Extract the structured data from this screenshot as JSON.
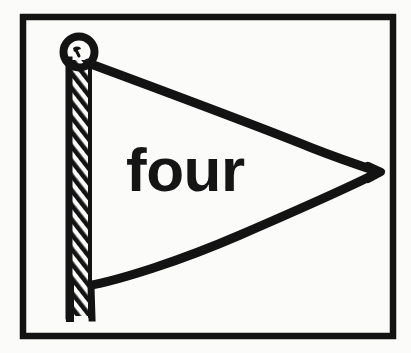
{
  "illustration": {
    "title": "four",
    "caption_word": "four",
    "subject": "pennant-flag-on-pole",
    "style": "black-and-white-line-drawing",
    "background_color": "#fbfbfa",
    "ink_color": "#131313",
    "frame": {
      "name": "picture-frame-border",
      "x": 20,
      "y": 14,
      "width": 376,
      "height": 325,
      "stroke_width": 6,
      "stroke_color": "#131313",
      "fill_color": "#fbfbfa"
    },
    "pole": {
      "name": "flag-pole",
      "x": 62,
      "top_y": 58,
      "bottom_y": 316,
      "width": 33,
      "shading": "diagonal-hatching",
      "stroke_color": "#131313"
    },
    "finial": {
      "name": "pole-knob",
      "center_x": 79,
      "center_y": 52,
      "outer_radius": 19,
      "inner_radius": 10,
      "shape": "ring"
    },
    "pennant": {
      "name": "pennant-triangle",
      "attach_top": {
        "x": 90,
        "y": 64
      },
      "tip": {
        "x": 379,
        "y": 172
      },
      "attach_bottom": {
        "x": 88,
        "y": 285
      },
      "stroke_width": 8,
      "fill": "none"
    },
    "word_label": {
      "name": "flag-word-label",
      "text": "four",
      "x": 126,
      "y": 139,
      "font_size": 62,
      "font_weight": "bold",
      "color": "#151515"
    }
  }
}
